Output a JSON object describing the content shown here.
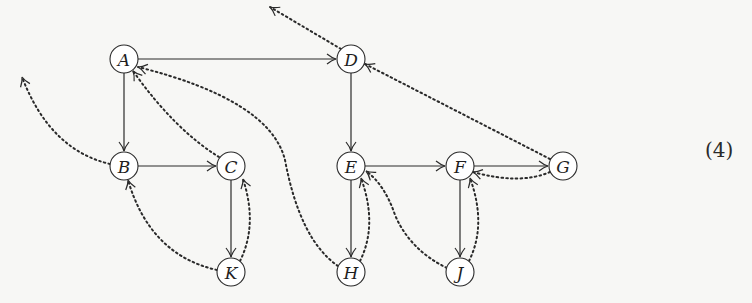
{
  "equation_label": "(4)",
  "colors": {
    "ink": "#2a2a2a",
    "background": "#f7f7f5",
    "node_fill": "#ffffff"
  },
  "nodes": [
    {
      "id": "A",
      "label": "A",
      "x": 124,
      "y": 59
    },
    {
      "id": "B",
      "label": "B",
      "x": 124,
      "y": 166
    },
    {
      "id": "C",
      "label": "C",
      "x": 231,
      "y": 166
    },
    {
      "id": "K",
      "label": "K",
      "x": 231,
      "y": 272
    },
    {
      "id": "D",
      "label": "D",
      "x": 351,
      "y": 59
    },
    {
      "id": "E",
      "label": "E",
      "x": 351,
      "y": 166
    },
    {
      "id": "F",
      "label": "F",
      "x": 460,
      "y": 166
    },
    {
      "id": "G",
      "label": "G",
      "x": 563,
      "y": 166
    },
    {
      "id": "H",
      "label": "H",
      "x": 351,
      "y": 272
    },
    {
      "id": "J",
      "label": "J",
      "x": 460,
      "y": 272
    }
  ],
  "tree_edges": [
    {
      "from": "A",
      "to": "D"
    },
    {
      "from": "A",
      "to": "B"
    },
    {
      "from": "B",
      "to": "C"
    },
    {
      "from": "C",
      "to": "K"
    },
    {
      "from": "D",
      "to": "E"
    },
    {
      "from": "E",
      "to": "F"
    },
    {
      "from": "E",
      "to": "H"
    },
    {
      "from": "F",
      "to": "G"
    },
    {
      "from": "F",
      "to": "J"
    }
  ],
  "back_edges": [
    {
      "from": "D",
      "to": "off-top-left"
    },
    {
      "from": "B",
      "to": "off-left"
    },
    {
      "from": "C",
      "to": "A"
    },
    {
      "from": "H",
      "to": "A"
    },
    {
      "from": "K",
      "to": "B"
    },
    {
      "from": "K",
      "to": "C"
    },
    {
      "from": "G",
      "to": "D"
    },
    {
      "from": "G",
      "to": "F"
    },
    {
      "from": "H",
      "to": "E"
    },
    {
      "from": "J",
      "to": "E"
    },
    {
      "from": "J",
      "to": "F"
    }
  ]
}
